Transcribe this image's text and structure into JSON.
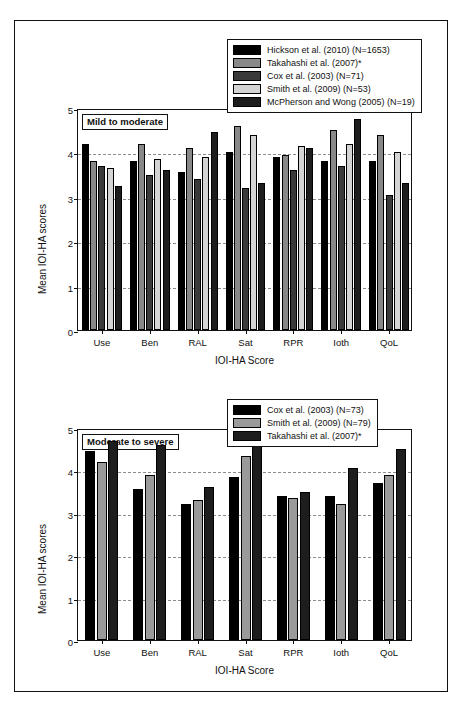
{
  "figure": {
    "background": "#ffffff",
    "frame_color": "#111111"
  },
  "chart_data": [
    {
      "id": "mild-to-moderate",
      "type": "bar",
      "title": "Mild to moderate",
      "xlabel": "IOI-HA Score",
      "ylabel": "Mean IOI-HA scores",
      "categories": [
        "Use",
        "Ben",
        "RAL",
        "Sat",
        "RPR",
        "Ioth",
        "QoL"
      ],
      "ylim": [
        0,
        5
      ],
      "yticks": [
        0,
        1,
        2,
        3,
        4,
        5
      ],
      "grid": true,
      "legend_position": "top-right",
      "series": [
        {
          "name": "Hickson et al. (2010) (N=1653)",
          "color": "#000000",
          "values": [
            4.2,
            3.8,
            3.55,
            4.0,
            3.9,
            3.8,
            3.8
          ]
        },
        {
          "name": "Takahashi et al. (2007)*",
          "color": "#888888",
          "values": [
            3.8,
            4.2,
            4.1,
            4.6,
            3.95,
            4.5,
            4.4
          ]
        },
        {
          "name": "Cox et al. (2003) (N=71)",
          "color": "#3a3a3a",
          "values": [
            3.7,
            3.5,
            3.4,
            3.2,
            3.6,
            3.7,
            3.05
          ]
        },
        {
          "name": "Smith et al. (2009) (N=53)",
          "color": "#d4d4d4",
          "values": [
            3.65,
            3.85,
            3.9,
            4.4,
            4.15,
            4.2,
            4.0
          ]
        },
        {
          "name": "McPherson and Wong (2005) (N=19)",
          "color": "#1d1d1d",
          "values": [
            3.25,
            3.6,
            4.45,
            3.3,
            4.1,
            4.75,
            3.3
          ]
        }
      ]
    },
    {
      "id": "moderate-to-severe",
      "type": "bar",
      "title": "Moderate to severe",
      "xlabel": "IOI-HA Score",
      "ylabel": "Mean IOI-HA scores",
      "categories": [
        "Use",
        "Ben",
        "RAL",
        "Sat",
        "RPR",
        "Ioth",
        "QoL"
      ],
      "ylim": [
        0,
        5
      ],
      "yticks": [
        0,
        1,
        2,
        3,
        4,
        5
      ],
      "grid": true,
      "legend_position": "top-right",
      "series": [
        {
          "name": "Cox et al. (2003) (N=73)",
          "color": "#000000",
          "values": [
            4.45,
            3.55,
            3.2,
            3.85,
            3.4,
            3.4,
            3.7
          ]
        },
        {
          "name": "Smith et al. (2009) (N=79)",
          "color": "#9a9a9a",
          "values": [
            4.2,
            3.9,
            3.3,
            4.35,
            3.35,
            3.2,
            3.9
          ]
        },
        {
          "name": "Takahashi et al. (2007)*",
          "color": "#1d1d1d",
          "values": [
            4.7,
            4.6,
            3.6,
            4.9,
            3.5,
            4.05,
            4.5
          ]
        }
      ]
    }
  ]
}
